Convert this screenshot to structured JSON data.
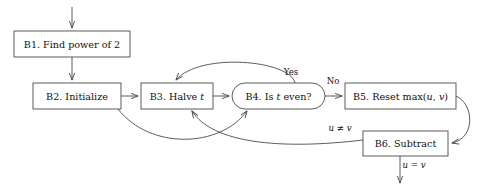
{
  "diagram": {
    "canvas": {
      "width": 491,
      "height": 190,
      "background": "#ffffff"
    },
    "style": {
      "stroke": "#4a4a4a",
      "text": "#111111",
      "fill": "#ffffff"
    },
    "nodes": [
      {
        "id": "B1",
        "shape": "rectangle",
        "label": "B1. Find power of 2",
        "label_prefix": "B1. Find power of 2",
        "x": 14,
        "y": 31,
        "w": 116,
        "h": 26
      },
      {
        "id": "B2",
        "shape": "rectangle",
        "label": "B2. Initialize",
        "label_prefix": "B2. Initialize",
        "x": 33,
        "y": 83,
        "w": 88,
        "h": 26
      },
      {
        "id": "B3",
        "shape": "rectangle",
        "label": "B3. Halve t",
        "label_prefix": "B3. Halve ",
        "label_math": "t",
        "label_suffix": "",
        "x": 141,
        "y": 83,
        "w": 72,
        "h": 26
      },
      {
        "id": "B4",
        "shape": "stadium",
        "label": "B4. Is t even?",
        "label_prefix": "B4. Is ",
        "label_math": "t",
        "label_suffix": " even?",
        "x": 232,
        "y": 83,
        "w": 93,
        "h": 26
      },
      {
        "id": "B5",
        "shape": "rectangle",
        "label": "B5. Reset max(u, v)",
        "label_prefix": "B5. Reset max(",
        "label_math": "u",
        "label_mid": ", ",
        "label_math2": "v",
        "label_suffix": ")",
        "x": 345,
        "y": 83,
        "w": 111,
        "h": 26
      },
      {
        "id": "B6",
        "shape": "rectangle",
        "label": "B6. Subtract",
        "label_prefix": "B6. Subtract",
        "x": 363,
        "y": 131,
        "w": 85,
        "h": 25
      }
    ],
    "edge_labels": [
      {
        "id": "yes",
        "text": "Yes",
        "x": 291,
        "y": 72
      },
      {
        "id": "no",
        "text": "No",
        "x": 333,
        "y": 80
      },
      {
        "id": "u-neq-v",
        "text": "u ≠ v",
        "math_a": "u",
        "op": " ≠ ",
        "math_b": "v",
        "x": 340,
        "y": 128
      },
      {
        "id": "u-eq-v",
        "text": "u = v",
        "math_a": "u",
        "op": " = ",
        "math_b": "v",
        "x": 412,
        "y": 165
      }
    ],
    "edges": [
      {
        "id": "entry-to-b1",
        "from": "entry",
        "to": "B1",
        "label": ""
      },
      {
        "id": "b1-to-b2",
        "from": "B1",
        "to": "B2",
        "label": ""
      },
      {
        "id": "b2-to-b3",
        "from": "B2",
        "to": "B3",
        "label": ""
      },
      {
        "id": "b3-to-b4",
        "from": "B3",
        "to": "B4",
        "label": ""
      },
      {
        "id": "b4-to-b5-no",
        "from": "B4",
        "to": "B5",
        "label": "No"
      },
      {
        "id": "b4-to-b3-yes",
        "from": "B4",
        "to": "B3",
        "label": "Yes"
      },
      {
        "id": "b2-to-b4",
        "from": "B2",
        "to": "B4",
        "label": ""
      },
      {
        "id": "b5-to-b6",
        "from": "B5",
        "to": "B6",
        "label": ""
      },
      {
        "id": "b6-to-b3",
        "from": "B6",
        "to": "B3",
        "label": "u ≠ v"
      },
      {
        "id": "b6-exit",
        "from": "B6",
        "to": "exit",
        "label": "u = v"
      }
    ]
  }
}
